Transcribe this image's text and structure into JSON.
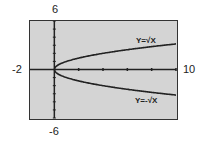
{
  "chart_data": {
    "type": "line",
    "title": "",
    "xlabel": "",
    "ylabel": "",
    "xlim": [
      -2,
      10
    ],
    "ylim": [
      -6,
      6
    ],
    "window_labels": {
      "ymax": "6",
      "ymin": "-6",
      "xmin": "-2",
      "xmax": "10"
    },
    "x_tick_spacing": 2,
    "y_tick_spacing": 1,
    "grid": false,
    "series": [
      {
        "name": "Y=√X",
        "label": "Y=√X",
        "function": "sqrt(x)",
        "x": [
          0,
          1,
          2,
          3,
          4,
          5,
          6,
          7,
          8,
          9,
          10
        ],
        "values": [
          0,
          1,
          1.41,
          1.73,
          2,
          2.24,
          2.45,
          2.65,
          2.83,
          3,
          3.16
        ]
      },
      {
        "name": "Y=-√X",
        "label": "Y=-√X",
        "function": "-sqrt(x)",
        "x": [
          0,
          1,
          2,
          3,
          4,
          5,
          6,
          7,
          8,
          9,
          10
        ],
        "values": [
          0,
          -1,
          -1.41,
          -1.73,
          -2,
          -2.24,
          -2.45,
          -2.65,
          -2.83,
          -3,
          -3.16
        ]
      }
    ],
    "colors": {
      "screen": "#d4d4d4",
      "curve": "#222222",
      "border": "#333333"
    }
  }
}
